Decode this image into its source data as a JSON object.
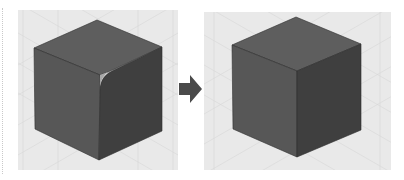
{
  "figure": {
    "colors": {
      "background": "#ffffff",
      "grid_panel": "#e9e9e9",
      "grid_line": "#d6d6d6",
      "cube_top": "#5e5e5e",
      "cube_left": "#575757",
      "cube_right": "#3f3f3f",
      "edge": "#2e2e2e",
      "fillet_highlight": "#a8a8a8",
      "arrow": "#4a4a4a"
    },
    "panels": [
      {
        "id": "before",
        "label": "Cube with filleted edge"
      },
      {
        "id": "after",
        "label": "Cube with sharp edge"
      }
    ],
    "arrow": {
      "icon": "right-arrow-icon",
      "label": "transforms to"
    }
  }
}
